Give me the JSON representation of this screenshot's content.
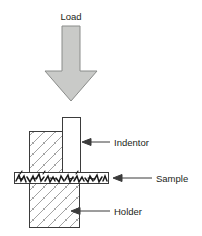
{
  "figure": {
    "type": "schematic-diagram",
    "background_color": "#ffffff"
  },
  "load_arrow": {
    "label": "Load",
    "direction": "down",
    "fill_color": "#c9cac8",
    "stroke_color": "#808080"
  },
  "parts": {
    "indentor": {
      "label": "Indentor",
      "fill_color": "#ffffff",
      "stroke_color": "#3b3b3b"
    },
    "sample": {
      "label": "Sample",
      "fill_color": "#ffffff",
      "stroke_color": "#3b3b3b",
      "texture": "jagged-fibrous-scribble"
    },
    "holder": {
      "label": "Holder",
      "fill_color": "#ffffff",
      "stroke_color": "#3b3b3b",
      "texture": "diagonal-hatch"
    }
  },
  "leader_arrows": {
    "color": "#3b3b3b",
    "head": "left-pointing"
  }
}
